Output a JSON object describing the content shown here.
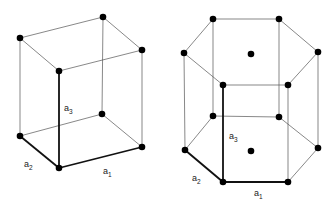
{
  "diagram": {
    "type": "lattice-unit-cells",
    "panels": [
      {
        "name": "simple-cubic-cell",
        "shape": "parallelepiped",
        "vectors": [
          {
            "base": "a",
            "sub": "1"
          },
          {
            "base": "a",
            "sub": "2"
          },
          {
            "base": "a",
            "sub": "3"
          }
        ]
      },
      {
        "name": "hexagonal-cell",
        "shape": "hexagonal-prism",
        "vectors": [
          {
            "base": "a",
            "sub": "1"
          },
          {
            "base": "a",
            "sub": "2"
          },
          {
            "base": "a",
            "sub": "3"
          }
        ]
      }
    ]
  }
}
